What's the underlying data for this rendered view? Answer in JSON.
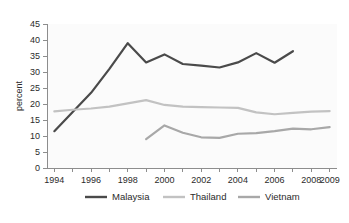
{
  "chart_data": {
    "type": "line",
    "title": "",
    "subtitle": "",
    "xlabel": "",
    "ylabel": "percent",
    "xlim": [
      1993.6,
      2009.4
    ],
    "ylim": [
      0,
      45
    ],
    "grid": false,
    "legend_position": "bottom",
    "y_ticks": [
      0,
      5,
      10,
      15,
      20,
      25,
      30,
      35,
      40,
      45
    ],
    "y_tick_labels": [
      "0",
      "5",
      "10",
      "15",
      "20",
      "25",
      "30",
      "35",
      "40",
      "45"
    ],
    "x_ticks": [
      1994,
      1995,
      1996,
      1997,
      1998,
      1999,
      2000,
      2001,
      2002,
      2003,
      2004,
      2005,
      2006,
      2007,
      2008,
      2009
    ],
    "x_tick_labels": [
      "1994",
      "",
      "1996",
      "",
      "1998",
      "",
      "2000",
      "",
      "2002",
      "",
      "2004",
      "",
      "2006",
      "",
      "2008",
      "2009"
    ],
    "x_labeled_ticks": [
      {
        "value": 1994,
        "label": "1994"
      },
      {
        "value": 1996,
        "label": "1996"
      },
      {
        "value": 1998,
        "label": "1998"
      },
      {
        "value": 2000,
        "label": "2000"
      },
      {
        "value": 2002,
        "label": "2002"
      },
      {
        "value": 2004,
        "label": "2004"
      },
      {
        "value": 2006,
        "label": "2006"
      },
      {
        "value": 2008,
        "label": "2008"
      },
      {
        "value": 2009,
        "label": "2009"
      }
    ],
    "series": [
      {
        "name": "Malaysia",
        "color": "#4a4a4a",
        "width": 2.2,
        "x": [
          1994,
          1995,
          1996,
          1997,
          1998,
          1999,
          2000,
          2001,
          2002,
          2003,
          2004,
          2005,
          2006,
          2007
        ],
        "values": [
          11.5,
          17.5,
          23.5,
          31.0,
          39.0,
          33.0,
          35.5,
          32.5,
          32.0,
          31.4,
          33.0,
          35.9,
          32.9,
          36.5
        ]
      },
      {
        "name": "Thailand",
        "color": "#c2c2c2",
        "width": 2.2,
        "x": [
          1994,
          1995,
          1996,
          1997,
          1998,
          1999,
          2000,
          2001,
          2002,
          2003,
          2004,
          2005,
          2006,
          2007,
          2008,
          2009
        ],
        "values": [
          17.7,
          18.2,
          18.6,
          19.2,
          20.2,
          21.2,
          19.7,
          19.2,
          19.0,
          18.9,
          18.8,
          17.4,
          16.8,
          17.2,
          17.6,
          17.8
        ]
      },
      {
        "name": "Vietnam",
        "color": "#a8a8a8",
        "width": 2.2,
        "x": [
          1999,
          2000,
          2001,
          2002,
          2003,
          2004,
          2005,
          2006,
          2007,
          2008,
          2009
        ],
        "values": [
          9.0,
          13.3,
          11.0,
          9.6,
          9.4,
          10.7,
          10.9,
          11.5,
          12.3,
          12.1,
          12.8
        ]
      }
    ],
    "legend": [
      {
        "label": "Malaysia",
        "color": "#4a4a4a"
      },
      {
        "label": "Thailand",
        "color": "#c2c2c2"
      },
      {
        "label": "Vietnam",
        "color": "#a8a8a8"
      }
    ]
  }
}
